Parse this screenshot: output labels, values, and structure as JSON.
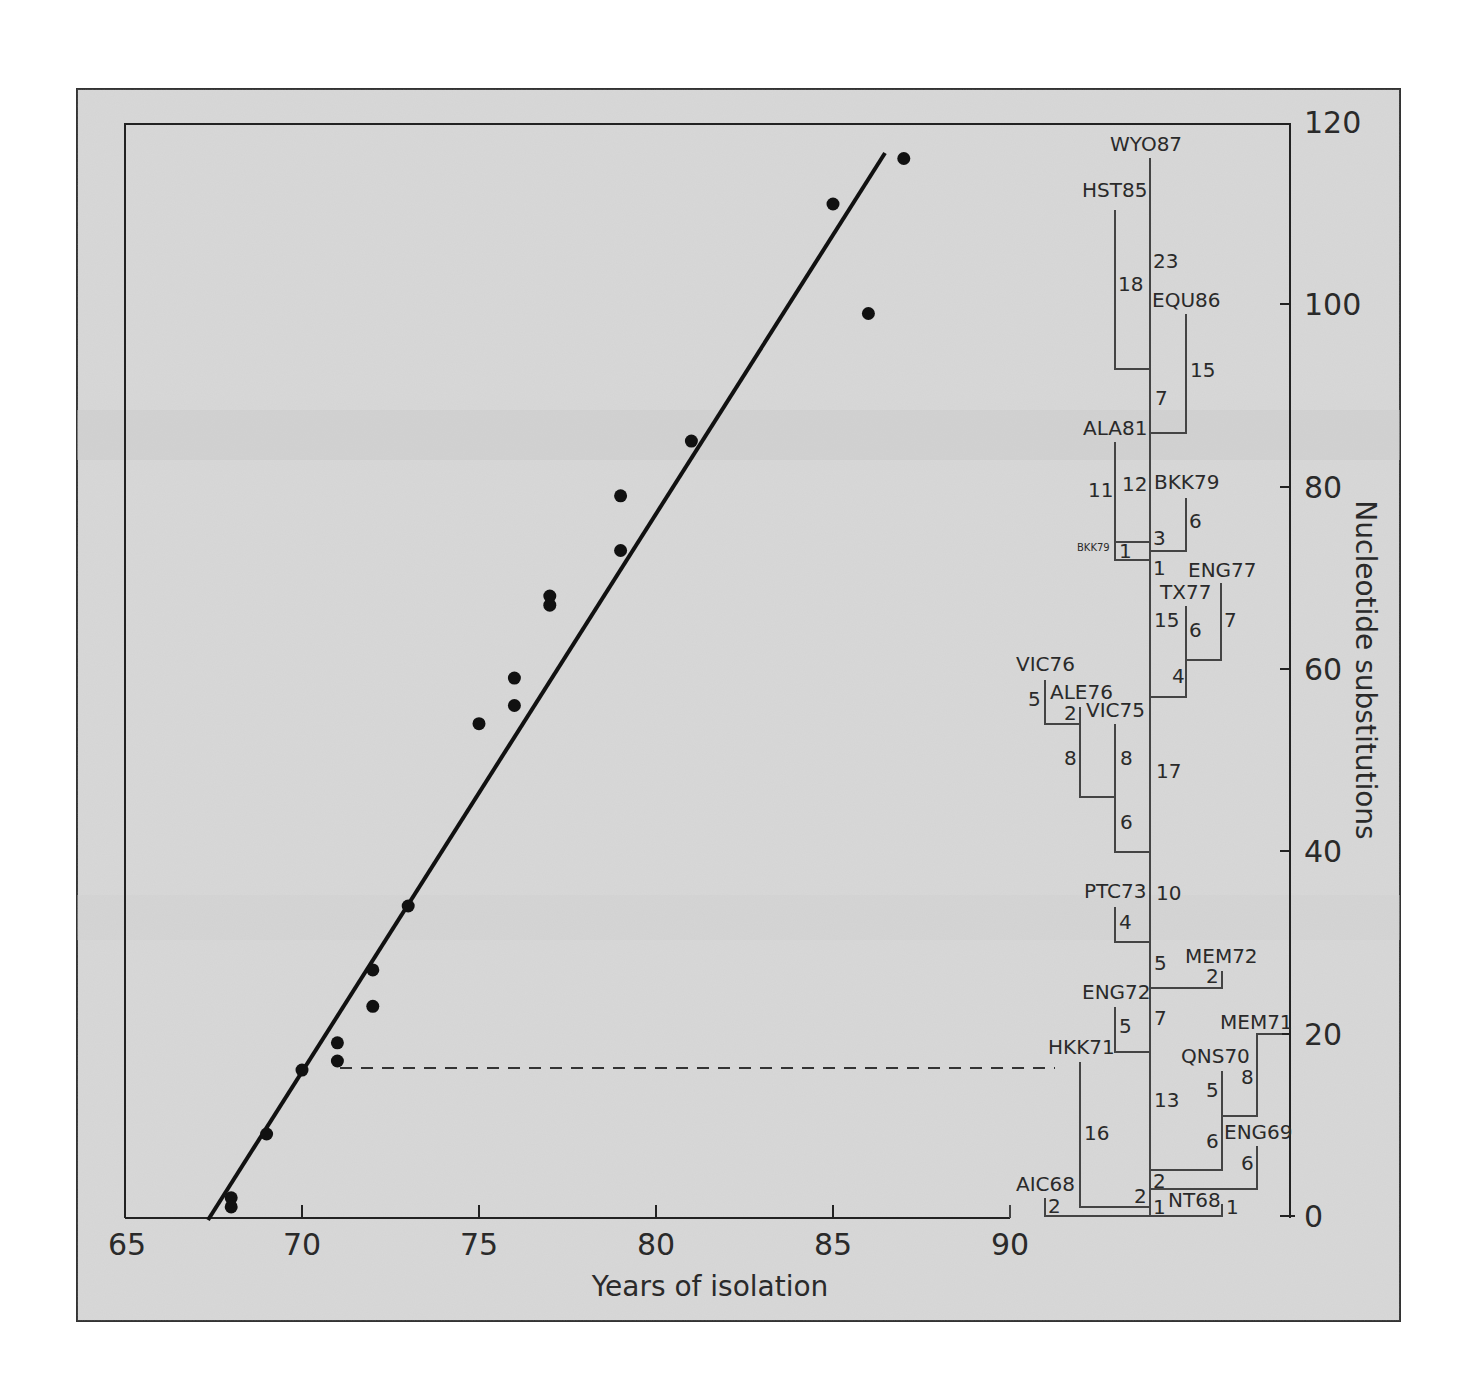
{
  "chart_data": {
    "type": "scatter",
    "title": "",
    "xlabel": "Years of isolation",
    "ylabel": "Nucleotide substitutions",
    "xlim": [
      65,
      90
    ],
    "ylim": [
      0,
      120
    ],
    "x_ticks": [
      "65",
      "70",
      "75",
      "80",
      "85",
      "90"
    ],
    "y_ticks": [
      "0",
      "20",
      "40",
      "60",
      "80",
      "100",
      "120"
    ],
    "grid": false,
    "legend": null,
    "series": [
      {
        "name": "isolates",
        "points": [
          {
            "x": 68,
            "y": 2
          },
          {
            "x": 68,
            "y": 1
          },
          {
            "x": 69,
            "y": 9
          },
          {
            "x": 70,
            "y": 16
          },
          {
            "x": 71,
            "y": 19
          },
          {
            "x": 71,
            "y": 17
          },
          {
            "x": 72,
            "y": 27
          },
          {
            "x": 72,
            "y": 23
          },
          {
            "x": 73,
            "y": 34
          },
          {
            "x": 75,
            "y": 54
          },
          {
            "x": 76,
            "y": 59
          },
          {
            "x": 76,
            "y": 56
          },
          {
            "x": 77,
            "y": 68
          },
          {
            "x": 77,
            "y": 67
          },
          {
            "x": 79,
            "y": 79
          },
          {
            "x": 79,
            "y": 73
          },
          {
            "x": 81,
            "y": 85
          },
          {
            "x": 85,
            "y": 111
          },
          {
            "x": 86,
            "y": 99
          },
          {
            "x": 87,
            "y": 116
          }
        ]
      }
    ],
    "regression_line": {
      "x0": 67.4,
      "y0": 0,
      "x1": 86.5,
      "y1": 117
    },
    "annotations": {
      "dashed_line": {
        "from_x": 71.2,
        "to_x": 91.2,
        "y": 16.5
      },
      "tree_leaves": [
        "WYO87",
        "HST85",
        "EQU86",
        "ALA81",
        "BKK79",
        "BKK79",
        "ENG77",
        "TX77",
        "VIC76",
        "ALE76",
        "VIC75",
        "PTC73",
        "MEM72",
        "ENG72",
        "MEM71",
        "HKK71",
        "QNS70",
        "ENG69",
        "AIC68",
        "NT68"
      ],
      "branch_lengths": [
        "23",
        "18",
        "15",
        "7",
        "11",
        "12",
        "6",
        "3",
        "1",
        "1",
        "15",
        "6",
        "7",
        "4",
        "5",
        "2",
        "8",
        "8",
        "17",
        "6",
        "10",
        "4",
        "5",
        "2",
        "7",
        "5",
        "13",
        "5",
        "8",
        "16",
        "6",
        "6",
        "2",
        "2",
        "2",
        "1",
        "1"
      ]
    }
  },
  "figure": {
    "x_axis_label": "Years of isolation",
    "y_axis_label": "Nucleotide substitutions",
    "x_ticks": [
      "65",
      "70",
      "75",
      "80",
      "85",
      "90"
    ],
    "y_ticks": [
      "0",
      "20",
      "40",
      "60",
      "80",
      "100",
      "120"
    ],
    "tree": {
      "leaves": {
        "wyo87": "WYO87",
        "hst85": "HST85",
        "equ86": "EQU86",
        "ala81": "ALA81",
        "bkk79a": "BKK79",
        "bkk79b": "BKK79",
        "eng77": "ENG77",
        "tx77": "TX77",
        "vic76": "VIC76",
        "ale76": "ALE76",
        "vic75": "VIC75",
        "ptc73": "PTC73",
        "mem72": "MEM72",
        "eng72": "ENG72",
        "mem71": "MEM71",
        "hkk71": "HKK71",
        "qns70": "QNS70",
        "eng69": "ENG69",
        "aic68": "AIC68",
        "nt68": "NT68"
      },
      "branches": {
        "b23": "23",
        "b18": "18",
        "b15a": "15",
        "b7a": "7",
        "b11": "11",
        "b12": "12",
        "b6a": "6",
        "b3": "3",
        "b1a": "1",
        "b1b": "1",
        "b15b": "15",
        "b6b": "6",
        "b7b": "7",
        "b4a": "4",
        "b5a": "5",
        "b2a": "2",
        "b8a": "8",
        "b8b": "8",
        "b17": "17",
        "b6c": "6",
        "b10": "10",
        "b4b": "4",
        "b5b": "5",
        "b2b": "2",
        "b7c": "7",
        "b5c": "5",
        "b13": "13",
        "b5d": "5",
        "b8c": "8",
        "b16": "16",
        "b6d": "6",
        "b6e": "6",
        "b2c": "2",
        "b2d": "2",
        "b2e": "2",
        "b1c": "1",
        "b1d": "1"
      }
    },
    "colors": {
      "background": "#d6d6d6",
      "ink": "#1a1a1a",
      "tree_line": "#444444"
    }
  }
}
